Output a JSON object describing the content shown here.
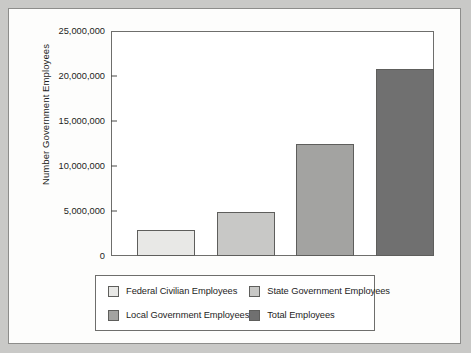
{
  "chart_data": {
    "type": "bar",
    "title": "",
    "xlabel": "",
    "ylabel": "Number Government Employees",
    "categories": [
      "Federal Civilian Employees",
      "State Government Employees",
      "Local Government Employees",
      "Total Employees"
    ],
    "values": [
      2900000,
      4900000,
      12400000,
      20800000
    ],
    "ylim": [
      0,
      25000000
    ],
    "ytick_values": [
      0,
      5000000,
      10000000,
      15000000,
      20000000,
      25000000
    ],
    "ytick_labels": [
      "0",
      "5,000,000",
      "10,000,000",
      "15,000,000",
      "20,000,000",
      "25,000,000"
    ],
    "grid": false,
    "legend_position": "bottom",
    "bar_colors": [
      "#e8e8e6",
      "#c8c8c6",
      "#a3a3a1",
      "#707070"
    ],
    "series": [
      {
        "name": "Number Government Employees",
        "values": [
          2900000,
          4900000,
          12400000,
          20800000
        ]
      }
    ]
  },
  "axis": {
    "y_title": "Number Government Employees",
    "ticks": [
      {
        "label": "25,000,000",
        "value": 25000000
      },
      {
        "label": "20,000,000",
        "value": 20000000
      },
      {
        "label": "15,000,000",
        "value": 15000000
      },
      {
        "label": "10,000,000",
        "value": 10000000
      },
      {
        "label": "5,000,000",
        "value": 5000000
      },
      {
        "label": "0",
        "value": 0
      }
    ]
  },
  "legend": {
    "items": [
      {
        "label": "Federal Civilian Employees",
        "color": "#e8e8e6"
      },
      {
        "label": "State Government Employees",
        "color": "#c8c8c6"
      },
      {
        "label": "Local Government Employees",
        "color": "#a3a3a1"
      },
      {
        "label": "Total Employees",
        "color": "#707070"
      }
    ]
  }
}
